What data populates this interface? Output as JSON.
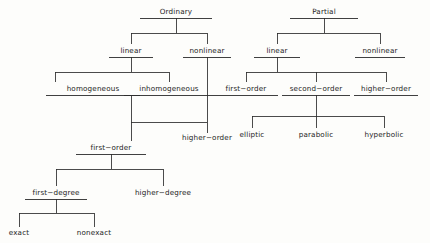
{
  "diagram": {
    "type": "tree-hierarchy",
    "text_color": "#1c1c1c",
    "line_color": "#2b2b2b",
    "background": "#fdfdfb",
    "nodes": [
      {
        "id": "ordinary",
        "label": "Ordinary",
        "x": 176,
        "y": 14,
        "half": 36,
        "underline": true
      },
      {
        "id": "ode_linear",
        "label": "linear",
        "x": 131,
        "y": 53,
        "half": 22,
        "underline": true
      },
      {
        "id": "ode_nonlinear",
        "label": "nonlinear",
        "x": 207,
        "y": 53,
        "half": 24,
        "underline": true
      },
      {
        "id": "homogeneous",
        "label": "homogeneous",
        "x": 93,
        "y": 91,
        "half": 47,
        "underline": true
      },
      {
        "id": "inhomogeneous",
        "label": "inhomogeneous",
        "x": 169,
        "y": 91,
        "half": 45,
        "underline": true
      },
      {
        "id": "ode_higher_order",
        "label": "higher−order",
        "x": 207,
        "y": 140,
        "half": 0,
        "underline": false
      },
      {
        "id": "first_order",
        "label": "first−order",
        "x": 111,
        "y": 150,
        "half": 35,
        "underline": true
      },
      {
        "id": "first_degree",
        "label": "first−degree",
        "x": 56,
        "y": 195,
        "half": 31,
        "underline": true
      },
      {
        "id": "higher_degree",
        "label": "higher−degree",
        "x": 163,
        "y": 195,
        "half": 0,
        "underline": false
      },
      {
        "id": "exact",
        "label": "exact",
        "x": 19,
        "y": 235,
        "half": 0,
        "underline": false
      },
      {
        "id": "nonexact",
        "label": "nonexact",
        "x": 94,
        "y": 235,
        "half": 0,
        "underline": false
      },
      {
        "id": "partial",
        "label": "Partial",
        "x": 324,
        "y": 14,
        "half": 34,
        "underline": true
      },
      {
        "id": "pde_linear",
        "label": "linear",
        "x": 277,
        "y": 53,
        "half": 23,
        "underline": true
      },
      {
        "id": "pde_nonlinear",
        "label": "nonlinear",
        "x": 380,
        "y": 53,
        "half": 25,
        "underline": true
      },
      {
        "id": "pde_first_order",
        "label": "first−order",
        "x": 246,
        "y": 91,
        "half": 32,
        "underline": true
      },
      {
        "id": "pde_second_order",
        "label": "second−order",
        "x": 316,
        "y": 91,
        "half": 34,
        "underline": true
      },
      {
        "id": "pde_higher_order",
        "label": "higher−order",
        "x": 386,
        "y": 91,
        "half": 32,
        "underline": true
      },
      {
        "id": "elliptic",
        "label": "elliptic",
        "x": 252,
        "y": 137,
        "half": 0,
        "underline": false
      },
      {
        "id": "parabolic",
        "label": "parabolic",
        "x": 316,
        "y": 137,
        "half": 0,
        "underline": false
      },
      {
        "id": "hyperbolic",
        "label": "hyperbolic",
        "x": 384,
        "y": 137,
        "half": 0,
        "underline": false
      }
    ],
    "edges": [
      {
        "id": "ordinary-bus",
        "d": "M176,18 L176,33 M131,33 L207,33 M131,33 L131,44 M207,33 L207,44"
      },
      {
        "id": "ode-linear-bus",
        "d": "M131,57 L131,72 M55,72 L169,72 M55,72 L55,82 M169,72 L169,82"
      },
      {
        "id": "ode-nonlinear-stem",
        "d": "M207,57 L207,133"
      },
      {
        "id": "homogeneous-merge",
        "d": "M131,95 L131,141 M131,122 L207,122"
      },
      {
        "id": "first-order-bus",
        "d": "M111,154 L111,169 M56,169 L163,169 M56,169 L56,186 M163,169 L163,186"
      },
      {
        "id": "first-degree-bus",
        "d": "M56,199 L56,213 M19,213 L94,213 M19,213 L19,227 M94,213 L94,227"
      },
      {
        "id": "partial-bus",
        "d": "M324,18 L324,33 M277,33 L380,33 M277,33 L277,44 M380,33 L380,44"
      },
      {
        "id": "pde-linear-bus",
        "d": "M277,57 L277,72 M246,72 L386,72 M246,72 L246,82 M316,72 L316,82 M386,72 L386,82"
      },
      {
        "id": "pde-second-order-bus",
        "d": "M316,95 L316,116 M252,116 L384,116 M252,116 L252,128 M316,116 L316,128 M384,116 L384,128"
      }
    ]
  }
}
